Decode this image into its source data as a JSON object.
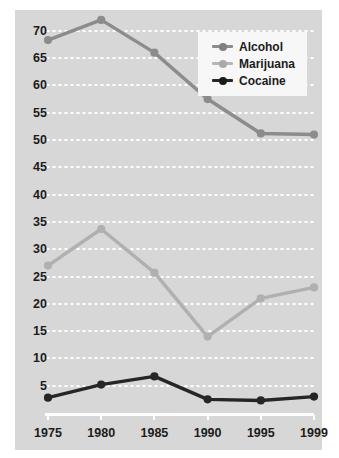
{
  "chart_data": {
    "type": "line",
    "title": "",
    "subtitle": "",
    "xlabel": "",
    "ylabel": "",
    "categories": [
      "1975",
      "1980",
      "1985",
      "1990",
      "1995",
      "1999"
    ],
    "x_tick_labels": [
      "1975",
      "1980",
      "1985",
      "1990",
      "1995",
      "1999"
    ],
    "y_tick_labels": [
      "5",
      "10",
      "15",
      "20",
      "25",
      "30",
      "35",
      "40",
      "45",
      "50",
      "55",
      "60",
      "65",
      "70"
    ],
    "y_ticks": [
      5,
      10,
      15,
      20,
      25,
      30,
      35,
      40,
      45,
      50,
      55,
      60,
      65,
      70
    ],
    "ylim": [
      0,
      74
    ],
    "grid": "horizontal-dotted-white",
    "legend_position": "top-right",
    "series": [
      {
        "name": "Alcohol",
        "color": "#8c8c8c",
        "values": [
          68.3,
          72.0,
          66.0,
          57.5,
          51.2,
          51.0
        ]
      },
      {
        "name": "Marijuana",
        "color": "#b0b0b0",
        "values": [
          27.0,
          33.7,
          25.7,
          14.0,
          21.0,
          23.0
        ]
      },
      {
        "name": "Cocaine",
        "color": "#262626",
        "values": [
          2.8,
          5.2,
          6.7,
          2.5,
          2.3,
          3.0
        ]
      }
    ]
  },
  "legend": {
    "entries": [
      {
        "label": "Alcohol",
        "color": "#8c8c8c",
        "icon": "line-marker-icon"
      },
      {
        "label": "Marijuana",
        "color": "#b0b0b0",
        "icon": "line-marker-icon"
      },
      {
        "label": "Cocaine",
        "color": "#262626",
        "icon": "line-marker-icon"
      }
    ]
  },
  "colors": {
    "panel_background": "#d7d7d7",
    "page_background": "#ffffff",
    "gridline": "#ffffff",
    "axis_line": "#ffffff",
    "tick_text": "#1c1c1c",
    "legend_background": "#f7f7f7",
    "alcohol": "#8c8c8c",
    "marijuana": "#b0b0b0",
    "cocaine": "#262626"
  }
}
